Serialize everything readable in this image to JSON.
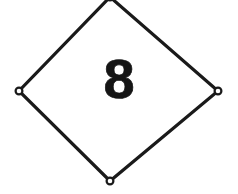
{
  "placard": {
    "shape": "diamond",
    "class_number": "8",
    "hazard_class_label": "8",
    "outline_color": "#1a1a1a",
    "fill_color": "#ffffff",
    "background_color": "#ffffff",
    "stroke_width_px": 3,
    "geometry": {
      "top_vertex": [
        110,
        -3
      ],
      "right_vertex": [
        218,
        91
      ],
      "bottom_vertex": [
        110,
        181
      ],
      "left_vertex": [
        19,
        91
      ]
    },
    "eyelets": [
      {
        "name": "eyelet-top",
        "cx": 110,
        "cy": -3,
        "r": 3.4,
        "visible": false
      },
      {
        "name": "eyelet-right",
        "cx": 218,
        "cy": 91,
        "r": 3.4,
        "visible": true
      },
      {
        "name": "eyelet-bottom",
        "cx": 110,
        "cy": 181,
        "r": 3.4,
        "visible": true
      },
      {
        "name": "eyelet-left",
        "cx": 19,
        "cy": 91,
        "r": 3.4,
        "visible": true
      }
    ]
  }
}
